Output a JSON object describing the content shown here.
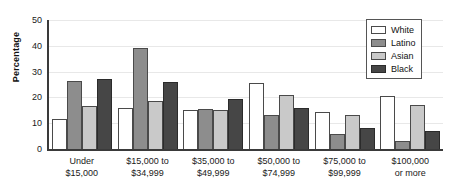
{
  "chart_data": {
    "type": "bar",
    "title": "",
    "xlabel": "",
    "ylabel": "Percentage",
    "ylim": [
      0,
      50
    ],
    "yticks": [
      0,
      10,
      20,
      30,
      40,
      50
    ],
    "grid": true,
    "legend_position": "top-right",
    "categories": [
      "Under $15,000",
      "$15,000 to $34,999",
      "$35,000 to $49,999",
      "$50,000 to $74,999",
      "$75,000 to $99,999",
      "$100,000 or more"
    ],
    "category_lines": [
      [
        "Under",
        "$15,000"
      ],
      [
        "$15,000 to",
        "$34,999"
      ],
      [
        "$35,000 to",
        "$49,999"
      ],
      [
        "$50,000 to",
        "$74,999"
      ],
      [
        "$75,000 to",
        "$99,999"
      ],
      [
        "$100,000",
        "or more"
      ]
    ],
    "series": [
      {
        "name": "White",
        "color": "#ffffff",
        "values": [
          11.5,
          16.0,
          15.0,
          25.5,
          14.5,
          20.5
        ]
      },
      {
        "name": "Latino",
        "color": "#8d8d8d",
        "values": [
          26.5,
          39.0,
          15.5,
          13.0,
          6.0,
          3.0
        ]
      },
      {
        "name": "Asian",
        "color": "#c9c9c9",
        "values": [
          16.5,
          18.5,
          15.0,
          21.0,
          13.0,
          17.0
        ]
      },
      {
        "name": "Black",
        "color": "#464646",
        "values": [
          27.0,
          26.0,
          19.5,
          16.0,
          8.0,
          7.0
        ]
      }
    ]
  }
}
